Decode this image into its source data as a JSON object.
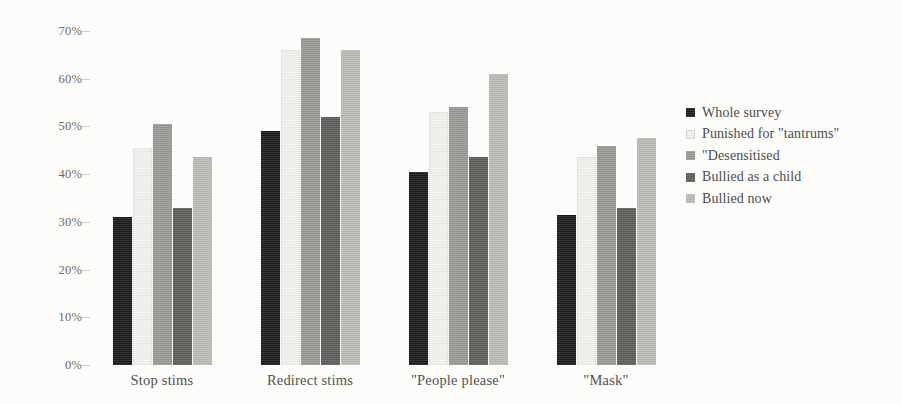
{
  "chart_data": {
    "type": "bar",
    "title": "",
    "subtitle": "",
    "xlabel": "",
    "ylabel": "",
    "categories": [
      "Stop stims",
      "Redirect stims",
      "\"People please\"",
      "\"Mask\""
    ],
    "series": [
      {
        "name": "Whole survey",
        "color": "#1c1a19",
        "values": [
          31.0,
          49.0,
          40.5,
          31.5
        ]
      },
      {
        "name": "Punished for \"tantrums\"",
        "color": "#f3f2ef",
        "values": [
          45.5,
          66.0,
          53.0,
          43.5
        ]
      },
      {
        "name": "\"Desensitised",
        "color": "#9a9895",
        "values": [
          50.5,
          68.5,
          54.0,
          46.0
        ]
      },
      {
        "name": "Bullied as a child",
        "color": "#5e5c59",
        "values": [
          33.0,
          52.0,
          43.5,
          33.0
        ]
      },
      {
        "name": "Bullied now",
        "color": "#bcbab7",
        "values": [
          43.5,
          66.0,
          61.0,
          47.5
        ]
      }
    ],
    "ylim": [
      0,
      70
    ],
    "ytick_step": 10,
    "ytick_labels": [
      "0%",
      "10%",
      "20%",
      "30%",
      "40%",
      "50%",
      "60%",
      "70%"
    ],
    "ytick_values": [
      0,
      10,
      20,
      30,
      40,
      50,
      60,
      70
    ],
    "grid": false,
    "legend_position": "right",
    "value_suffix": "%"
  },
  "legend": {
    "entries": [
      {
        "label": "Whole survey"
      },
      {
        "label": "Punished for \"tantrums\""
      },
      {
        "label": "\"Desensitised"
      },
      {
        "label": "Bullied as a child"
      },
      {
        "label": "Bullied now"
      }
    ]
  }
}
